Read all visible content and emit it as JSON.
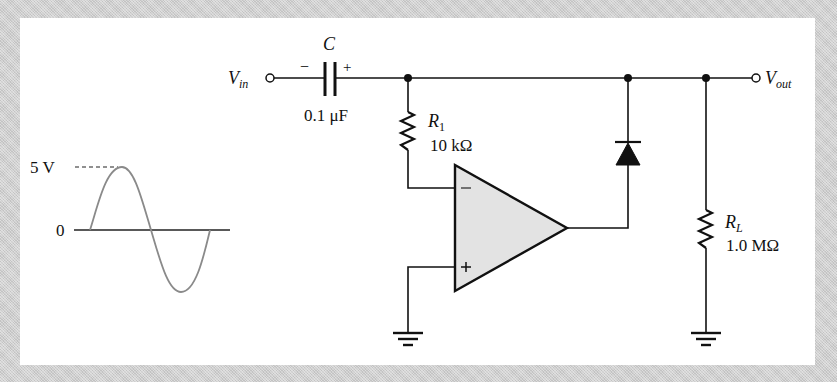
{
  "figure": {
    "type": "op-amp clamping circuit (positive clamper)",
    "colors": {
      "background_border": "#cfcfcf",
      "panel": "#ffffff",
      "ink": "#111111",
      "opamp_fill": "#e3e3e3",
      "waveform": "#8a8a8a"
    }
  },
  "input_waveform": {
    "peak_label": "5 V",
    "zero_label": "0",
    "shape": "sine",
    "amplitude_v": 5
  },
  "terminals": {
    "vin": {
      "main": "V",
      "sub": "in"
    },
    "vout": {
      "main": "V",
      "sub": "out"
    }
  },
  "capacitor": {
    "name": "C",
    "value": "0.1 μF",
    "polarity_left": "−",
    "polarity_right": "+"
  },
  "r1": {
    "name": "R",
    "sub": "1",
    "value": "10 kΩ"
  },
  "rl": {
    "name": "R",
    "sub": "L",
    "value": "1.0 MΩ"
  },
  "opamp": {
    "inverting_label": "−",
    "noninverting_label": "+"
  },
  "diode": {
    "orientation": "anode at op-amp output, cathode to output node"
  }
}
